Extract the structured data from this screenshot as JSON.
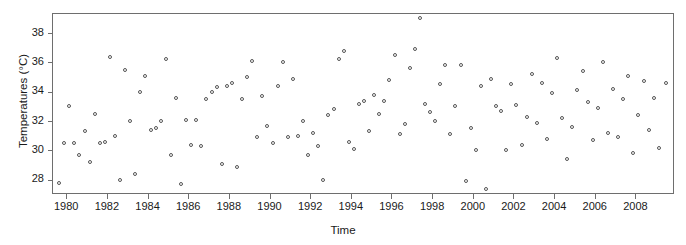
{
  "chart_data": {
    "type": "scatter",
    "title": "",
    "xlabel": "Time",
    "ylabel": "Temperatures (°C)",
    "xlim": [
      1979.3,
      2009.8
    ],
    "ylim": [
      27.1,
      39.3
    ],
    "grid": false,
    "legend": null,
    "marker": "open-circle",
    "marker_color": "#555555",
    "xticks": [
      1980,
      1982,
      1984,
      1986,
      1988,
      1990,
      1992,
      1994,
      1996,
      1998,
      2000,
      2002,
      2004,
      2006,
      2008
    ],
    "xtick_labels": [
      "1980",
      "1982",
      "1984",
      "1986",
      "1988",
      "1990",
      "1992",
      "1994",
      "1996",
      "1998",
      "2000",
      "2002",
      "2004",
      "2006",
      "2008"
    ],
    "yticks": [
      28,
      30,
      32,
      34,
      36,
      38
    ],
    "ytick_labels": [
      "28",
      "30",
      "32",
      "34",
      "36",
      "38"
    ],
    "x": [
      1979.6,
      1979.85,
      1980.1,
      1980.35,
      1980.6,
      1980.85,
      1981.1,
      1981.35,
      1981.6,
      1981.85,
      1982.1,
      1982.35,
      1982.6,
      1982.85,
      1983.1,
      1983.35,
      1983.6,
      1983.85,
      1984.1,
      1984.35,
      1984.6,
      1984.85,
      1985.1,
      1985.35,
      1985.6,
      1985.85,
      1986.1,
      1986.35,
      1986.6,
      1986.85,
      1987.1,
      1987.35,
      1987.6,
      1987.85,
      1988.1,
      1988.35,
      1988.6,
      1988.85,
      1989.1,
      1989.35,
      1989.6,
      1989.85,
      1990.1,
      1990.35,
      1990.6,
      1990.85,
      1991.1,
      1991.35,
      1991.6,
      1991.85,
      1992.1,
      1992.35,
      1992.6,
      1992.85,
      1993.1,
      1993.35,
      1993.6,
      1993.85,
      1994.1,
      1994.35,
      1994.6,
      1994.85,
      1995.1,
      1995.35,
      1995.6,
      1995.85,
      1996.1,
      1996.35,
      1996.6,
      1996.85,
      1997.1,
      1997.35,
      1997.6,
      1997.85,
      1998.1,
      1998.35,
      1998.6,
      1998.85,
      1999.1,
      1999.35,
      1999.6,
      1999.85,
      2000.1,
      2000.35,
      2000.6,
      2000.85,
      2001.1,
      2001.35,
      2001.6,
      2001.85,
      2002.1,
      2002.35,
      2002.6,
      2002.85,
      2003.1,
      2003.35,
      2003.6,
      2003.85,
      2004.1,
      2004.35,
      2004.6,
      2004.85,
      2005.1,
      2005.35,
      2005.6,
      2005.85,
      2006.1,
      2006.35,
      2006.6,
      2006.85,
      2007.1,
      2007.35,
      2007.6,
      2007.85,
      2008.1,
      2008.35,
      2008.6,
      2008.85,
      2009.1,
      2009.45
    ],
    "y": [
      27.8,
      30.5,
      33.0,
      30.5,
      29.7,
      31.3,
      29.2,
      32.5,
      30.5,
      30.6,
      36.4,
      31.0,
      28.0,
      35.5,
      32.0,
      28.4,
      34.0,
      35.1,
      31.4,
      31.5,
      32.0,
      36.2,
      29.7,
      33.6,
      27.7,
      32.1,
      30.4,
      32.1,
      30.3,
      33.5,
      34.0,
      34.3,
      29.1,
      34.4,
      34.6,
      28.9,
      33.5,
      35.0,
      36.1,
      30.9,
      33.7,
      31.7,
      30.5,
      34.4,
      36.0,
      30.9,
      34.9,
      31.0,
      32.0,
      29.7,
      31.2,
      30.3,
      28.0,
      32.4,
      32.8,
      36.2,
      36.8,
      30.6,
      30.1,
      33.2,
      33.4,
      31.3,
      33.8,
      32.5,
      33.4,
      34.8,
      36.5,
      31.1,
      31.8,
      35.6,
      36.9,
      39.0,
      33.2,
      32.6,
      32.0,
      34.5,
      35.8,
      31.1,
      33.0,
      35.8,
      27.9,
      31.5,
      30.0,
      34.4,
      27.4,
      34.9,
      33.0,
      32.7,
      30.0,
      34.5,
      33.1,
      30.4,
      32.3,
      35.2,
      31.9,
      34.6,
      30.8,
      33.9,
      36.3,
      32.2,
      29.4,
      31.6,
      34.1,
      35.4,
      33.3,
      30.7,
      32.9,
      36.0,
      31.2,
      34.2,
      30.9,
      33.5,
      35.1,
      29.8,
      32.4,
      34.7,
      31.4,
      33.6,
      30.2,
      34.6
    ]
  },
  "axes": {
    "x_title": "Time",
    "y_title": "Temperatures (°C)"
  }
}
